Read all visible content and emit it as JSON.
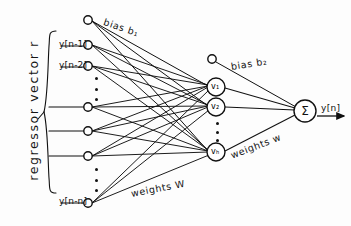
{
  "figure": {
    "kind": "neural-network-diagram",
    "title_caption": "regressor vector r",
    "ink_color": "#111111",
    "background_color": "#fdfdfd"
  },
  "watermark": {
    "text": ""
  },
  "input_layer": {
    "bias_node": {
      "label": "",
      "cx": 88,
      "cy": 19,
      "r": 4
    },
    "bias_annotation": "bias b₁",
    "taps": [
      {
        "name": "tap-1",
        "label": "y[n-1]",
        "cx": 88,
        "cy": 44,
        "r": 4
      },
      {
        "name": "tap-2",
        "label": "y[n-2]",
        "cx": 88,
        "cy": 65,
        "r": 4
      },
      {
        "name": "tap-3",
        "label": "",
        "cx": 88,
        "cy": 106,
        "r": 4
      },
      {
        "name": "tap-4",
        "label": "",
        "cx": 88,
        "cy": 130,
        "r": 4
      },
      {
        "name": "tap-5",
        "label": "",
        "cx": 88,
        "cy": 155,
        "r": 4
      },
      {
        "name": "tap-n",
        "label": "y[n-n]",
        "cx": 88,
        "cy": 202,
        "r": 4
      }
    ],
    "ellipsis_groups": 2,
    "weights_annotation": "weights W"
  },
  "hidden_layer": {
    "bias_node": {
      "label": "",
      "cx": 212,
      "cy": 59,
      "r": 4
    },
    "bias_annotation": "bias b₂",
    "nodes": [
      {
        "name": "v1",
        "label": "v₁",
        "cx": 216,
        "cy": 87,
        "r": 9
      },
      {
        "name": "v2",
        "label": "v₂",
        "cx": 216,
        "cy": 107,
        "r": 9
      },
      {
        "name": "vh",
        "label": "vₕ",
        "cx": 216,
        "cy": 152,
        "r": 9
      }
    ],
    "ellipsis_groups": 1,
    "weights_annotation": "weights w"
  },
  "output_layer": {
    "node": {
      "symbol": "Σ",
      "cx": 305,
      "cy": 110,
      "r": 11
    },
    "label": "y[n]",
    "arrow": {
      "from_x": 315,
      "to_x": 347,
      "y": 115
    }
  },
  "brace": {
    "label": "regressor vector r"
  }
}
